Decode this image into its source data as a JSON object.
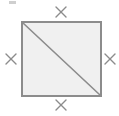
{
  "figure": {
    "canvas": {
      "width": 119,
      "height": 116,
      "background": "#ffffff"
    },
    "shape": {
      "name": "square",
      "fill": "#f0f0f0",
      "stroke": "#8c8c8c",
      "stroke_width": 2,
      "x": 22,
      "y": 22,
      "width": 79,
      "height": 74,
      "vertices": [
        {
          "label": "top-left",
          "x": 22,
          "y": 22
        },
        {
          "label": "top-right",
          "x": 101,
          "y": 22
        },
        {
          "label": "bottom-right",
          "x": 101,
          "y": 96
        },
        {
          "label": "bottom-left",
          "x": 22,
          "y": 96
        }
      ]
    },
    "diagonal": {
      "name": "diagonal-top-left-to-bottom-right",
      "stroke": "#8c8c8c",
      "stroke_width": 1.6,
      "x1": 23,
      "y1": 23,
      "x2": 100,
      "y2": 95
    },
    "tick_marks": {
      "glyph": "X",
      "stroke": "#8c8c8c",
      "stroke_width": 1.4,
      "arm": 5,
      "meaning": "congruent sides",
      "count": 4,
      "marks": [
        {
          "name": "tick-top",
          "side": "top",
          "cx": 61,
          "cy": 12
        },
        {
          "name": "tick-right",
          "side": "right",
          "cx": 110,
          "cy": 59
        },
        {
          "name": "tick-bottom",
          "side": "bottom",
          "cx": 61,
          "cy": 105
        },
        {
          "name": "tick-left",
          "side": "left",
          "cx": 11,
          "cy": 59
        }
      ]
    },
    "artifact": {
      "name": "top-left-speck",
      "x": 9,
      "y": 1,
      "width": 7,
      "height": 3,
      "fill": "#bfbfbf"
    },
    "caption": "Square with diagonal; all four sides marked congruent"
  }
}
